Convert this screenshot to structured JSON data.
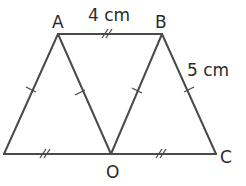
{
  "diagram": {
    "type": "geometry-figure",
    "points": {
      "A": {
        "label": "A"
      },
      "B": {
        "label": "B"
      },
      "C": {
        "label": "C"
      },
      "O": {
        "label": "O"
      }
    },
    "measurements": {
      "AB": "4 cm",
      "BC": "5 cm"
    },
    "segments": [
      {
        "from": "D",
        "to": "A",
        "marks": "single-tick"
      },
      {
        "from": "A",
        "to": "O",
        "marks": "single-tick"
      },
      {
        "from": "O",
        "to": "B",
        "marks": "single-tick"
      },
      {
        "from": "B",
        "to": "C",
        "marks": "single-tick"
      },
      {
        "from": "A",
        "to": "B",
        "marks": "double-tick"
      },
      {
        "from": "D",
        "to": "O",
        "marks": "double-tick"
      },
      {
        "from": "O",
        "to": "C",
        "marks": "double-tick"
      }
    ]
  }
}
